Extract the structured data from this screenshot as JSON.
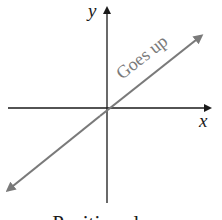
{
  "diagram": {
    "axes": {
      "x_label": "x",
      "y_label": "y",
      "axis_color": "#1a1a1a"
    },
    "line": {
      "label": "Goes up",
      "color": "#7a7a7a"
    },
    "caption": "Positive slope"
  }
}
